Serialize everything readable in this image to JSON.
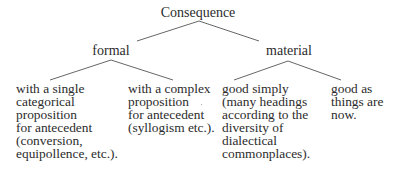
{
  "diagram": {
    "type": "tree",
    "root": {
      "label": "Consequence",
      "children": [
        {
          "label": "formal",
          "children": [
            {
              "lines": [
                "with a single",
                "categorical",
                "proposition",
                "for antecedent",
                "(conversion,",
                "equipollence, etc.)."
              ]
            },
            {
              "lines": [
                "with a complex",
                "proposition",
                "for antecedent",
                "(syllogism etc.)."
              ]
            }
          ]
        },
        {
          "label": "material",
          "children": [
            {
              "lines": [
                "good simply",
                "(many headings",
                "according to the",
                "diversity of",
                "dialectical",
                "commonplaces)."
              ]
            },
            {
              "lines": [
                "good as",
                "things are",
                "now."
              ]
            }
          ]
        }
      ]
    },
    "colors": {
      "text": "#2b2b2b",
      "lines": "#555555",
      "background": "#ffffff"
    }
  }
}
